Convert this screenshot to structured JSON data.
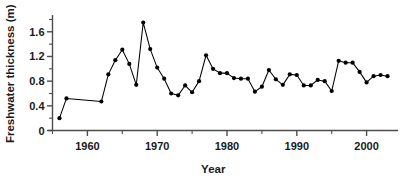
{
  "chart_data": {
    "type": "line",
    "title": "",
    "xlabel": "Year",
    "ylabel": "Freshwater thickness (m)",
    "xlim": [
      1955.0,
      2004.5
    ],
    "ylim": [
      0,
      1.84
    ],
    "grid": false,
    "legend": null,
    "marker": "filled-circle",
    "line_color": "#000000",
    "marker_color": "#000000",
    "x_ticks_major": [
      1960,
      1970,
      1980,
      1990,
      2000
    ],
    "x_tick_labels": [
      "1960",
      "1970",
      "1980",
      "1990",
      "2000"
    ],
    "x_ticks_minor": [
      1955,
      1965,
      1975,
      1985,
      1995
    ],
    "y_ticks_major": [
      0,
      0.4,
      0.8,
      1.2,
      1.6
    ],
    "y_tick_labels": [
      "0",
      "0.4",
      "0.8",
      "1.2",
      "1.6"
    ],
    "y_ticks_minor": [
      0.2,
      0.6,
      1.0,
      1.4,
      1.8
    ],
    "x": [
      1956,
      1957,
      1962,
      1963,
      1964,
      1965,
      1966,
      1967,
      1968,
      1969,
      1970,
      1971,
      1972,
      1973,
      1974,
      1975,
      1976,
      1977,
      1978,
      1979,
      1980,
      1981,
      1982,
      1983,
      1984,
      1985,
      1986,
      1987,
      1988,
      1989,
      1990,
      1991,
      1992,
      1993,
      1994,
      1995,
      1996,
      1997,
      1998,
      1999,
      2000,
      2001,
      2002,
      2003
    ],
    "values": [
      0.2,
      0.52,
      0.47,
      0.91,
      1.14,
      1.31,
      1.08,
      0.74,
      1.75,
      1.32,
      1.02,
      0.84,
      0.6,
      0.57,
      0.73,
      0.62,
      0.8,
      1.22,
      1.0,
      0.93,
      0.93,
      0.85,
      0.84,
      0.84,
      0.63,
      0.71,
      0.98,
      0.83,
      0.74,
      0.91,
      0.9,
      0.73,
      0.73,
      0.82,
      0.8,
      0.64,
      1.13,
      1.1,
      1.1,
      0.95,
      0.78,
      0.88,
      0.9,
      0.88
    ]
  }
}
